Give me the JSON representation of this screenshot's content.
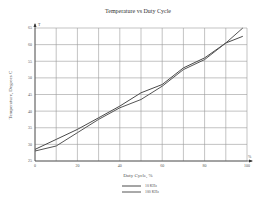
{
  "chart_data": {
    "type": "line",
    "title": "Temperature vs Duty Cycle",
    "xlabel": "Duty Cycle, %",
    "ylabel": "Temperature, Degrees C",
    "x_axis_marker": "%",
    "y_axis_marker": "T",
    "xlim": [
      0,
      100
    ],
    "ylim": [
      25,
      65
    ],
    "xticks": [
      0,
      20,
      40,
      60,
      80,
      100
    ],
    "yticks": [
      25,
      30,
      35,
      40,
      45,
      50,
      55,
      60,
      65
    ],
    "x_gridlines": [
      0,
      10,
      20,
      30,
      40,
      50,
      60,
      70,
      80,
      90,
      100
    ],
    "grid": true,
    "legend_position": "bottom-center",
    "series": [
      {
        "name": "10 KHz",
        "color": "#4a4a4a",
        "x": [
          0,
          10,
          20,
          30,
          40,
          50,
          60,
          70,
          80,
          90,
          98
        ],
        "values": [
          28.5,
          31.5,
          34.5,
          38,
          41.5,
          45.5,
          48,
          53,
          56,
          60.5,
          62.5
        ]
      },
      {
        "name": "100 KHz",
        "color": "#555555",
        "x": [
          0,
          10,
          20,
          30,
          40,
          50,
          60,
          70,
          80,
          90,
          98
        ],
        "values": [
          28,
          29.5,
          33.5,
          37.5,
          41,
          43.5,
          47.5,
          52.5,
          55.5,
          60.5,
          65
        ]
      }
    ]
  }
}
